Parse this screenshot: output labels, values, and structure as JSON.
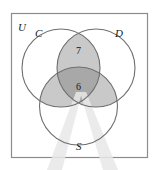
{
  "figure": {
    "type": "venn-diagram-three-sets",
    "universe_label": "U",
    "sets": [
      {
        "id": "C",
        "label": "C",
        "position": "top-left"
      },
      {
        "id": "D",
        "label": "D",
        "position": "top-right"
      },
      {
        "id": "S",
        "label": "S",
        "position": "bottom-center"
      }
    ],
    "region_counts": [
      {
        "region": "C-and-D-only",
        "value": "7"
      },
      {
        "region": "C-and-D-and-S",
        "value": "6"
      }
    ],
    "shading": {
      "light_gray": "#c9c9c9",
      "dark_gray": "#a8a8a8",
      "outline": "#6b6b6b",
      "border": "#8c8c8c",
      "streak": "#e4e4e4",
      "background": "#ffffff"
    },
    "shaded_regions": [
      "C-intersect-D",
      "C-intersect-S",
      "D-intersect-S",
      "C-intersect-D-intersect-S"
    ],
    "artifacts": [
      {
        "name": "light-streak-left"
      },
      {
        "name": "light-streak-right"
      }
    ]
  }
}
